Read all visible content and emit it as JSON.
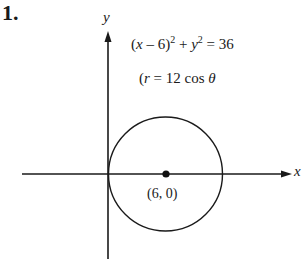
{
  "problem": {
    "number": "1."
  },
  "axes": {
    "x_label": "x",
    "y_label": "y"
  },
  "equations": {
    "cartesian": {
      "open": "(",
      "var_x": "x",
      "minus_part": " – 6)",
      "exp1": "2",
      "plus": " + ",
      "var_y": "y",
      "exp2": "2",
      "rhs": " = 36"
    },
    "polar": {
      "open": "(",
      "var_r": "r",
      "rest": " = 12 cos ",
      "theta": "θ"
    }
  },
  "circle": {
    "center_label": "(6, 0)",
    "center": [
      6,
      0
    ],
    "radius": 6
  },
  "colors": {
    "ink": "#1a1a1a",
    "background": "#ffffff"
  }
}
